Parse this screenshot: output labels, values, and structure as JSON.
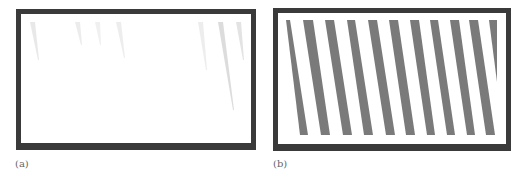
{
  "figure": {
    "panels": [
      {
        "id": "a",
        "caption": "(a)",
        "description": "Framed nearly blank white area with faint gray streaks near top",
        "frame_color": "#3a3a3a",
        "streaks": [
          {
            "x1": 32,
            "y1": 22,
            "x2": 38,
            "y2": 60,
            "opacity": 0.18
          },
          {
            "x1": 77,
            "y1": 22,
            "x2": 81,
            "y2": 45,
            "opacity": 0.15
          },
          {
            "x1": 97,
            "y1": 22,
            "x2": 100,
            "y2": 45,
            "opacity": 0.12
          },
          {
            "x1": 118,
            "y1": 22,
            "x2": 124,
            "y2": 58,
            "opacity": 0.14
          },
          {
            "x1": 200,
            "y1": 22,
            "x2": 206,
            "y2": 70,
            "opacity": 0.14
          },
          {
            "x1": 220,
            "y1": 22,
            "x2": 233,
            "y2": 110,
            "opacity": 0.28
          },
          {
            "x1": 238,
            "y1": 22,
            "x2": 243,
            "y2": 60,
            "opacity": 0.22
          }
        ]
      },
      {
        "id": "b",
        "caption": "(b)",
        "description": "Framed area with evenly spaced slanted gray stripes",
        "frame_color": "#3a3a3a",
        "stripe_color": "#7a7a7a",
        "stripes": [
          {
            "tx1": 286,
            "tx2": 290,
            "bx1": 300,
            "bx2": 308,
            "by": 135
          },
          {
            "tx1": 303,
            "tx2": 313,
            "bx1": 321,
            "bx2": 330,
            "by": 135
          },
          {
            "tx1": 325,
            "tx2": 334,
            "bx1": 343,
            "bx2": 352,
            "by": 135
          },
          {
            "tx1": 347,
            "tx2": 355,
            "bx1": 364,
            "bx2": 373,
            "by": 135
          },
          {
            "tx1": 368,
            "tx2": 377,
            "bx1": 386,
            "bx2": 395,
            "by": 135
          },
          {
            "tx1": 389,
            "tx2": 398,
            "bx1": 406,
            "bx2": 415,
            "by": 135
          },
          {
            "tx1": 410,
            "tx2": 419,
            "bx1": 427,
            "bx2": 435,
            "by": 135
          },
          {
            "tx1": 430,
            "tx2": 438,
            "bx1": 447,
            "bx2": 455,
            "by": 135
          },
          {
            "tx1": 450,
            "tx2": 459,
            "bx1": 467,
            "bx2": 475,
            "by": 135
          },
          {
            "tx1": 469,
            "tx2": 478,
            "bx1": 486,
            "bx2": 495,
            "by": 135
          },
          {
            "tx1": 489,
            "tx2": 497,
            "bx1": 497,
            "bx2": 497,
            "by": 82
          }
        ]
      }
    ]
  }
}
